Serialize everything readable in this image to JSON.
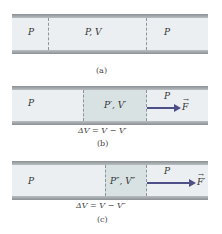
{
  "panels": [
    {
      "id": "a",
      "caption": "(a)",
      "regions": [
        {
          "label": "P"
        },
        {
          "label": "P, V"
        },
        {
          "label": "P"
        }
      ]
    },
    {
      "id": "b",
      "caption": "(b)",
      "regions": [
        {
          "label": "P"
        },
        {
          "label": "P′, V′"
        },
        {
          "label": "P"
        }
      ],
      "force_label": "F",
      "delta_v": "ΔV = V − V′"
    },
    {
      "id": "c",
      "caption": "(c)",
      "regions": [
        {
          "label": "P"
        },
        {
          "label": "P″, V″"
        },
        {
          "label": "P"
        }
      ],
      "force_label": "F′",
      "delta_v": "ΔV = V − V″"
    }
  ],
  "colors": {
    "tube_fill": "#eceff1",
    "shaded_region": "#d9e2e3",
    "wall": "#8a9094",
    "arrow": "#4d4f86"
  },
  "vector_symbol": "→"
}
